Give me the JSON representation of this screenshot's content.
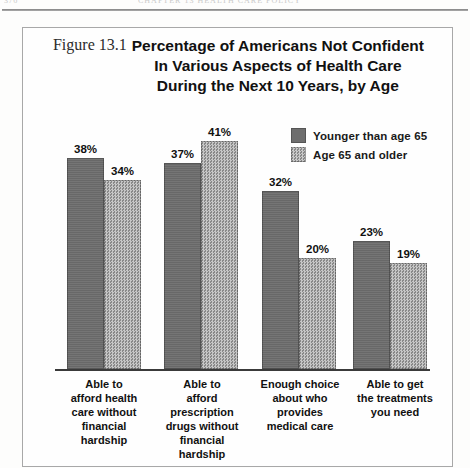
{
  "page": {
    "folio": "376",
    "running_title": "CHAPTER 13  HEALTH CARE POLICY"
  },
  "figure": {
    "number": "Figure 13.1",
    "title_lines": [
      "Percentage of Americans Not Confident",
      "In Various Aspects of Health Care",
      "During the Next 10 Years, by Age"
    ]
  },
  "colors": {
    "younger": "#6e6e6e",
    "older": "#9c9c9c",
    "axis": "#3a3a3a",
    "border": "#a8a8a8"
  },
  "chart_data": {
    "type": "bar",
    "title": "Percentage of Americans Not Confident In Various Aspects of Health Care During the Next 10 Years, by Age",
    "xlabel": "",
    "ylabel": "",
    "ylim": [
      0,
      45
    ],
    "grid": false,
    "legend_position": "top-right",
    "value_suffix": "%",
    "categories": [
      "Able to afford health care without financial hardship",
      "Able to afford prescription drugs without financial hardship",
      "Enough choice about who provides medical care",
      "Able to get the treatments you need"
    ],
    "category_lines": [
      [
        "Able to",
        "afford health",
        "care without",
        "financial",
        "hardship"
      ],
      [
        "Able to",
        "afford",
        "prescription",
        "drugs without",
        "financial",
        "hardship"
      ],
      [
        "Enough choice",
        "about who",
        "provides",
        "medical care"
      ],
      [
        "Able to get",
        "the treatments",
        "you need"
      ]
    ],
    "series": [
      {
        "name": "Younger than age 65",
        "color": "#6e6e6e",
        "values": [
          38,
          37,
          32,
          23
        ],
        "labels": [
          "38%",
          "37%",
          "32%",
          "23%"
        ]
      },
      {
        "name": "Age 65 and older",
        "color": "#9c9c9c",
        "values": [
          34,
          41,
          20,
          19
        ],
        "labels": [
          "34%",
          "41%",
          "20%",
          "19%"
        ]
      }
    ]
  }
}
